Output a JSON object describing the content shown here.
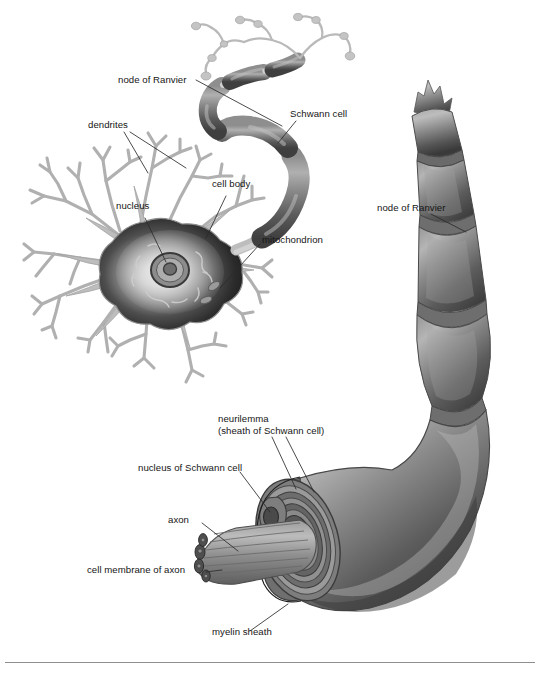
{
  "figure": {
    "kind": "anatomical-illustration",
    "palette": {
      "background": "#ffffff",
      "dendrite_outline": "#b4b4b4",
      "dendrite_fill": "#ffffff",
      "soma_dark": "#2c2c2c",
      "soma_light": "#f2f2f2",
      "myelin_mid": "#7a7a7a",
      "myelin_dark": "#4a4a4a",
      "myelin_light": "#a9a9a9",
      "leader_line": "#2a2a2a",
      "text": "#151515",
      "rule": "#8e8e8e"
    }
  },
  "labels": {
    "node_of_ranvier_top": "node of Ranvier",
    "schwann_cell": "Schwann cell",
    "dendrites": "dendrites",
    "cell_body": "cell body",
    "nucleus": "nucleus",
    "mitochondrion": "mitochondrion",
    "node_of_ranvier_right": "node of Ranvier",
    "neurilemma": "neurilemma\n(sheath of Schwann cell)",
    "nucleus_of_schwann_cell": "nucleus of Schwann cell",
    "axon": "axon",
    "cell_membrane_of_axon": "cell membrane of axon",
    "myelin_sheath": "myelin sheath"
  }
}
